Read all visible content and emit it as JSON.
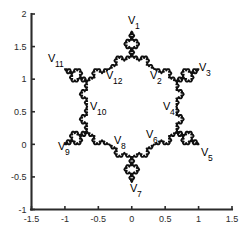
{
  "figure": {
    "background_color": "#ffffff",
    "curve_color": "#101010",
    "axis_color": "#2b2b2b"
  },
  "chart_data": {
    "type": "line",
    "title": "",
    "xlabel": "",
    "ylabel": "",
    "grid": false,
    "legend": null,
    "xlim": [
      -1.5,
      1.5
    ],
    "ylim": [
      -1.0,
      2.0
    ],
    "xticks": [
      "-1.5",
      "-1",
      "-0.5",
      "0",
      "0.5",
      "1",
      "1.5"
    ],
    "xtick_values": [
      -1.5,
      -1,
      -0.5,
      0,
      0.5,
      1,
      1.5
    ],
    "yticks": [
      "2",
      "1.5",
      "1",
      "0.5",
      "0",
      "-0.5",
      "-1"
    ],
    "ytick_values": [
      2,
      1.5,
      1,
      0.5,
      0,
      -0.5,
      -1
    ],
    "shape": "koch-snowflake",
    "iterations": 3,
    "seed_polygon": "hexagram",
    "seed_vertices_x": [
      0.0,
      0.3333,
      1.0,
      0.6667,
      1.0,
      0.3333,
      0.0,
      -0.3333,
      -1.0,
      -0.6667,
      -1.0,
      -0.3333
    ],
    "seed_vertices_y": [
      1.7321,
      1.1547,
      1.1547,
      0.5774,
      0.0,
      0.0,
      -0.5774,
      0.0,
      0.0,
      0.5774,
      1.1547,
      1.1547
    ],
    "annotations": [
      {
        "text": "V",
        "sub": "1",
        "x": 0.0,
        "y": 1.7321,
        "label_x": 128,
        "label_y": 24
      },
      {
        "text": "V",
        "sub": "2",
        "x": 0.3333,
        "y": 1.1547,
        "label_x": 150,
        "label_y": 79
      },
      {
        "text": "V",
        "sub": "3",
        "x": 1.0,
        "y": 1.1547,
        "label_x": 199,
        "label_y": 71
      },
      {
        "text": "V",
        "sub": "4",
        "x": 0.6667,
        "y": 0.5774,
        "label_x": 163,
        "label_y": 110
      },
      {
        "text": "V",
        "sub": "5",
        "x": 1.0,
        "y": 0.0,
        "label_x": 201,
        "label_y": 156
      },
      {
        "text": "V",
        "sub": "6",
        "x": 0.3333,
        "y": 0.0,
        "label_x": 146,
        "label_y": 138
      },
      {
        "text": "V",
        "sub": "7",
        "x": 0.0,
        "y": -0.5774,
        "label_x": 130,
        "label_y": 192
      },
      {
        "text": "V",
        "sub": "8",
        "x": -0.3333,
        "y": 0.0,
        "label_x": 114,
        "label_y": 144
      },
      {
        "text": "V",
        "sub": "9",
        "x": -1.0,
        "y": 0.0,
        "label_x": 58,
        "label_y": 150
      },
      {
        "text": "V",
        "sub": "10",
        "x": -0.6667,
        "y": 0.5774,
        "label_x": 90,
        "label_y": 110
      },
      {
        "text": "V",
        "sub": "11",
        "x": -1.0,
        "y": 1.1547,
        "label_x": 48,
        "label_y": 62
      },
      {
        "text": "V",
        "sub": "12",
        "x": -0.3333,
        "y": 1.1547,
        "label_x": 106,
        "label_y": 79
      }
    ]
  }
}
